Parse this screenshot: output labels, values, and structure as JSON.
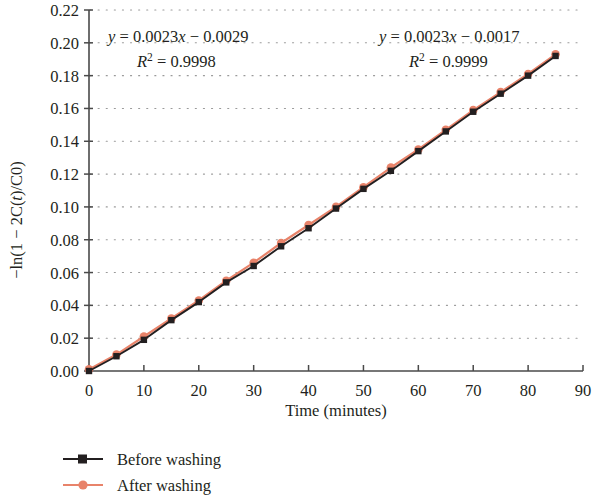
{
  "chart_data": {
    "type": "line",
    "title": "",
    "xlabel": "Time (minutes)",
    "ylabel": "−ln(1 − 2C(t)/C0)",
    "xlim": [
      0,
      90
    ],
    "ylim": [
      0,
      0.22
    ],
    "xticks": [
      0,
      10,
      20,
      30,
      40,
      50,
      60,
      70,
      80,
      90
    ],
    "xtick_labels": [
      "0",
      "10",
      "20",
      "30",
      "40",
      "50",
      "60",
      "70",
      "80",
      "90"
    ],
    "yticks": [
      0.0,
      0.02,
      0.04,
      0.06,
      0.08,
      0.1,
      0.12,
      0.14,
      0.16,
      0.18,
      0.2,
      0.22
    ],
    "ytick_labels": [
      "0.00",
      "0.02",
      "0.04",
      "0.06",
      "0.08",
      "0.10",
      "0.12",
      "0.14",
      "0.16",
      "0.18",
      "0.20",
      "0.22"
    ],
    "grid": "horizontal-dotted",
    "legend_position": "below-left",
    "x": [
      0,
      5,
      10,
      15,
      20,
      25,
      30,
      35,
      40,
      45,
      50,
      55,
      60,
      65,
      70,
      75,
      80,
      85
    ],
    "series": [
      {
        "name": "Before washing",
        "color": "#231f20",
        "marker": "square",
        "values": [
          0.0,
          0.009,
          0.019,
          0.031,
          0.042,
          0.054,
          0.064,
          0.076,
          0.087,
          0.099,
          0.111,
          0.122,
          0.134,
          0.146,
          0.158,
          0.169,
          0.18,
          0.192
        ]
      },
      {
        "name": "After washing",
        "color": "#e8836a",
        "marker": "circle",
        "values": [
          0.001,
          0.01,
          0.021,
          0.032,
          0.043,
          0.055,
          0.066,
          0.078,
          0.089,
          0.1,
          0.112,
          0.124,
          0.135,
          0.147,
          0.159,
          0.17,
          0.181,
          0.193
        ]
      }
    ],
    "annotations": [
      {
        "name": "before-washing-fit",
        "equation_y": "y",
        "equation_eq": " = 0.0023",
        "equation_x": "x",
        "equation_tail": " − 0.0029",
        "r2_symbol": "R",
        "r2_sup": "2",
        "r2_value": " = 0.9998"
      },
      {
        "name": "after-washing-fit",
        "equation_y": "y",
        "equation_eq": " = 0.0023",
        "equation_x": "x",
        "equation_tail": " − 0.0017",
        "r2_symbol": "R",
        "r2_sup": "2",
        "r2_value": " = 0.9999"
      }
    ]
  },
  "axis": {
    "xlabel": "Time (minutes)",
    "ylabel": "−ln(1 − 2C(t)/C0)",
    "ylabel_parts": {
      "prefix": "−ln(1 − 2C(",
      "italic_t": "t",
      "suffix": ")/C0)"
    }
  },
  "legend": {
    "items": [
      {
        "label": "Before washing",
        "color": "#231f20",
        "marker": "square"
      },
      {
        "label": "After washing",
        "color": "#e8836a",
        "marker": "circle"
      }
    ]
  },
  "colors": {
    "before": "#231f20",
    "after": "#e8836a",
    "grid": "#9a9a9a",
    "axis": "#4a4a4a",
    "background": "#ffffff"
  }
}
